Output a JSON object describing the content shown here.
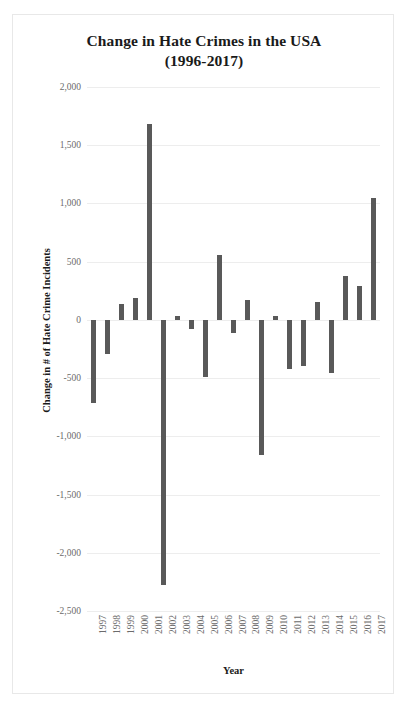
{
  "chart_data": {
    "type": "bar",
    "title": "Change in Hate Crimes in the USA",
    "subtitle": "(1996-2017)",
    "title_line1": "Change in Hate Crimes in the USA",
    "title_line2": "(1996-2017)",
    "xlabel": "Year",
    "ylabel": "Change in # of Hate Crime Incidents",
    "ylim": [
      -2500,
      2000
    ],
    "ytick_labels": [
      "2,000",
      "1,500",
      "1,000",
      "500",
      "0",
      "-500",
      "-1,000",
      "-1,500",
      "-2,000",
      "-2,500"
    ],
    "ytick_values": [
      2000,
      1500,
      1000,
      500,
      0,
      -500,
      -1000,
      -1500,
      -2000,
      -2500
    ],
    "grid": true,
    "legend": false,
    "bar_color": "#595959",
    "categories": [
      "1997",
      "1998",
      "1999",
      "2000",
      "2001",
      "2002",
      "2003",
      "2004",
      "2005",
      "2006",
      "2007",
      "2008",
      "2009",
      "2010",
      "2011",
      "2012",
      "2013",
      "2014",
      "2015",
      "2016",
      "2017"
    ],
    "values": [
      -710,
      -295,
      140,
      185,
      1680,
      -2275,
      35,
      -75,
      -490,
      555,
      -110,
      170,
      -1160,
      30,
      -420,
      -400,
      150,
      -455,
      375,
      290,
      1045
    ]
  }
}
